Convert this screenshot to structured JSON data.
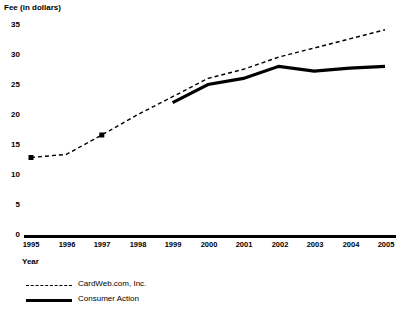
{
  "chart_data": {
    "type": "line",
    "title": "",
    "ylabel": "Fee (in dollars)",
    "xlabel": "Year",
    "categories": [
      "1995",
      "1996",
      "1997",
      "1998",
      "1999",
      "2000",
      "2001",
      "2002",
      "2003",
      "2004",
      "2005"
    ],
    "ylim": [
      0,
      35
    ],
    "yticks": [
      0,
      5,
      10,
      15,
      20,
      25,
      30,
      35
    ],
    "ytick_labels": [
      "0",
      "5",
      "10",
      "15",
      "20",
      "25",
      "30",
      "35"
    ],
    "grid": false,
    "legend_position": "below-left",
    "series": [
      {
        "name": "CardWeb.com, Inc.",
        "style": "dashed",
        "markers": "square",
        "x": [
          "1995",
          "1996",
          "1997",
          "1998",
          "1999",
          "2000",
          "2001",
          "2002",
          "2003",
          "2004",
          "2005"
        ],
        "values": [
          13,
          13.5,
          16.7,
          20,
          23,
          26,
          27.5,
          29.5,
          31,
          32.5,
          34
        ]
      },
      {
        "name": "Consumer Action",
        "style": "solid",
        "markers": "none",
        "x": [
          "1999",
          "2000",
          "2001",
          "2002",
          "2003",
          "2004",
          "2005"
        ],
        "values": [
          22,
          25,
          26,
          28,
          27.2,
          27.7,
          28
        ]
      }
    ]
  },
  "axis": {
    "y_title": "Fee (in dollars)",
    "x_title": "Year",
    "y_ticks": [
      "35",
      "30",
      "25",
      "20",
      "15",
      "10",
      "5",
      "0"
    ],
    "x_ticks": [
      "1995",
      "1996",
      "1997",
      "1998",
      "1999",
      "2000",
      "2001",
      "2002",
      "2003",
      "2004",
      "2005"
    ]
  },
  "legend": {
    "items": [
      {
        "label": "CardWeb.com, Inc.",
        "style": "dashed"
      },
      {
        "label": "Consumer Action",
        "style": "solid"
      }
    ]
  },
  "colors": {
    "ink": "#000000",
    "background": "#ffffff"
  }
}
